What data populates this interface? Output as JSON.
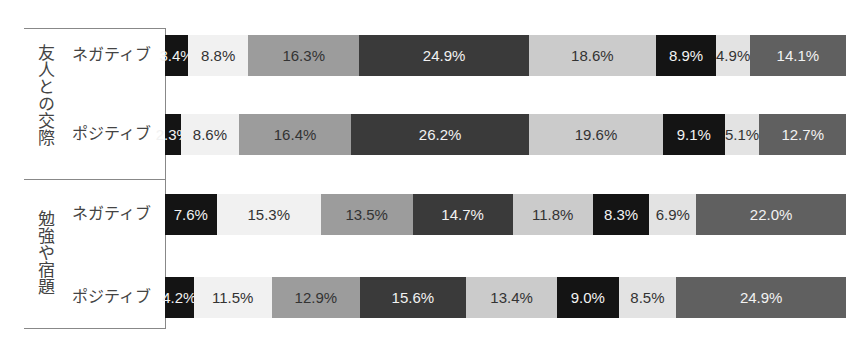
{
  "chart_data": {
    "type": "bar",
    "orientation": "horizontal-stacked-100",
    "title": "",
    "xlabel": "",
    "ylabel": "",
    "legend": null,
    "grid": false,
    "groups": [
      {
        "label": "友人との交際",
        "rows": [
          {
            "label": "ネガティブ",
            "values": [
              3.4,
              8.8,
              16.3,
              24.9,
              18.6,
              8.9,
              4.9,
              14.1
            ],
            "labels": [
              "3.4%",
              "8.8%",
              "16.3%",
              "24.9%",
              "18.6%",
              "8.9%",
              "4.9%",
              "14.1%"
            ]
          },
          {
            "label": "ポジティブ",
            "values": [
              2.3,
              8.6,
              16.4,
              26.2,
              19.6,
              9.1,
              5.1,
              12.7
            ],
            "labels": [
              "2.3%",
              "8.6%",
              "16.4%",
              "26.2%",
              "19.6%",
              "9.1%",
              "5.1%",
              "12.7%"
            ]
          }
        ]
      },
      {
        "label": "勉強や宿題",
        "rows": [
          {
            "label": "ネガティブ",
            "values": [
              7.6,
              15.3,
              13.5,
              14.7,
              11.8,
              8.3,
              6.9,
              22.0
            ],
            "labels": [
              "7.6%",
              "15.3%",
              "13.5%",
              "14.7%",
              "11.8%",
              "8.3%",
              "6.9%",
              "22.0%"
            ]
          },
          {
            "label": "ポジティブ",
            "values": [
              4.2,
              11.5,
              12.9,
              15.6,
              13.4,
              9.0,
              8.5,
              24.9
            ],
            "labels": [
              "4.2%",
              "11.5%",
              "12.9%",
              "15.6%",
              "13.4%",
              "9.0%",
              "8.5%",
              "24.9%"
            ]
          }
        ]
      }
    ],
    "segment_colors": [
      "#141414",
      "#f1f1f1",
      "#9c9c9c",
      "#3a3a3a",
      "#cbcbcb",
      "#141414",
      "#e3e3e3",
      "#606060"
    ]
  }
}
